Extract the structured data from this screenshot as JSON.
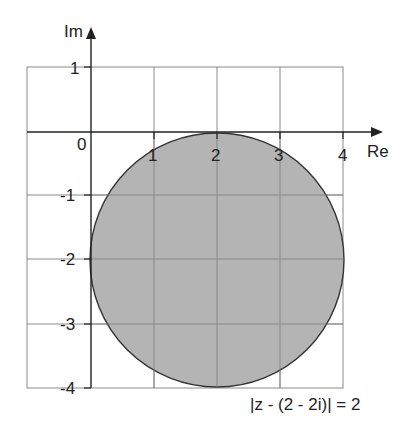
{
  "diagram": {
    "type": "argand-diagram",
    "axes": {
      "x_label": "Re",
      "y_label": "Im",
      "origin_label": "0",
      "x_ticks": [
        "1",
        "2",
        "3",
        "4"
      ],
      "y_ticks": [
        "1",
        "-1",
        "-2",
        "-3",
        "-4"
      ]
    },
    "region": {
      "shape": "disc",
      "center": [
        2,
        -2
      ],
      "radius": 2,
      "fill": "#b4b4b4",
      "stroke": "#333333"
    },
    "equation": "|z - (2 - 2i)| = 2",
    "grid": {
      "x_range": [
        -1,
        4
      ],
      "y_range": [
        -4,
        1
      ],
      "color": "#8a8a8a"
    }
  }
}
